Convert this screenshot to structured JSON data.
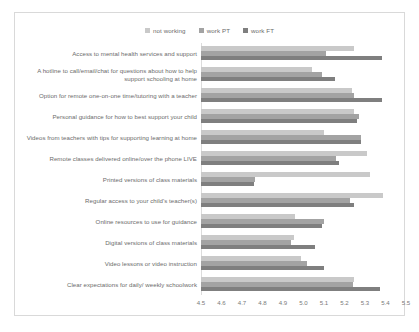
{
  "chart_data": {
    "type": "bar",
    "orientation": "horizontal",
    "title": "",
    "xlabel": "",
    "ylabel": "",
    "xlim": [
      4.5,
      5.5
    ],
    "xticks": [
      "4.5",
      "4.6",
      "4.7",
      "4.8",
      "4.9",
      "5.0",
      "5.1",
      "5.2",
      "5.3",
      "5.4",
      "5.5"
    ],
    "grid": false,
    "legend_position": "top-center",
    "categories": [
      "Access to mental health services and support",
      "A hotline to call/email/chat for questions about how to help support schooling at home",
      "Option for remote one-on-one time/tutoring with a teacher",
      "Personal guidance for how to best support your child",
      "Videos from teachers with tips for supporting learning at home",
      "Remote classes delivered online/over the phone LIVE",
      "Printed versions of class materials",
      "Regular access to your child's teacher(s)",
      "Online resources to use for guidance",
      "Digital versions of class materials",
      "Video lessons or video instruction",
      "Clear expectations for daily/ weekly schoolwork"
    ],
    "series": [
      {
        "name": "not working",
        "color": "#c9c9c9",
        "values": [
          5.245,
          5.04,
          5.235,
          5.245,
          5.1,
          5.31,
          5.325,
          5.39,
          4.96,
          4.955,
          4.99,
          5.245
        ]
      },
      {
        "name": "work PT",
        "color": "#a3a3a3",
        "values": [
          5.11,
          5.09,
          5.245,
          5.27,
          5.28,
          5.16,
          4.765,
          5.225,
          5.1,
          4.94,
          5.015,
          5.24
        ]
      },
      {
        "name": "work FT",
        "color": "#7f7f7f",
        "values": [
          5.385,
          5.155,
          5.385,
          5.26,
          5.28,
          5.175,
          4.76,
          5.245,
          5.09,
          5.055,
          5.1,
          5.375
        ]
      }
    ]
  },
  "legend": {
    "entries": [
      {
        "label": "not working"
      },
      {
        "label": "work PT"
      },
      {
        "label": "work FT"
      }
    ]
  }
}
